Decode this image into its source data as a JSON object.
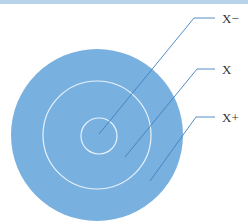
{
  "diagram": {
    "labels": {
      "inner": "X−",
      "middle": "X",
      "outer": "X+"
    },
    "colors": {
      "disc_fill": "#78b0e0",
      "ring_stroke": "#e8f2fb",
      "leader_line": "#3f80c0",
      "top_bar": "#b9d3ea"
    }
  }
}
